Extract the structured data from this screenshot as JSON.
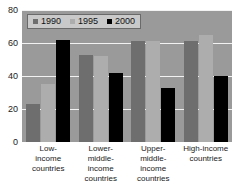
{
  "chart_data": {
    "type": "bar",
    "title": "",
    "xlabel": "",
    "ylabel": "",
    "ylim": [
      0,
      80
    ],
    "yticks": [
      0,
      20,
      40,
      60,
      80
    ],
    "grid": true,
    "legend_position": "top-left",
    "categories": [
      "Low-income countries",
      "Lower-middle-income countries",
      "Upper-middle-income countries",
      "High-income countries"
    ],
    "category_lines": [
      [
        "Low-",
        "income",
        "countries"
      ],
      [
        "Lower-",
        "middle-",
        "income",
        "countries"
      ],
      [
        "Upper-",
        "middle-",
        "income",
        "countries"
      ],
      [
        "High-income",
        "countries"
      ]
    ],
    "series": [
      {
        "name": "1990",
        "color": "#6e6e6e",
        "values": [
          23,
          53,
          61,
          61
        ]
      },
      {
        "name": "1995",
        "color": "#adadad",
        "values": [
          35,
          52,
          61,
          65
        ]
      },
      {
        "name": "2000",
        "color": "#000000",
        "values": [
          62,
          42,
          33,
          40
        ]
      }
    ]
  },
  "legend": {
    "items": [
      {
        "label": "1990"
      },
      {
        "label": "1995"
      },
      {
        "label": "2000"
      }
    ]
  },
  "axis": {
    "y_tick_labels": [
      "80",
      "60",
      "40",
      "20",
      "0"
    ]
  }
}
